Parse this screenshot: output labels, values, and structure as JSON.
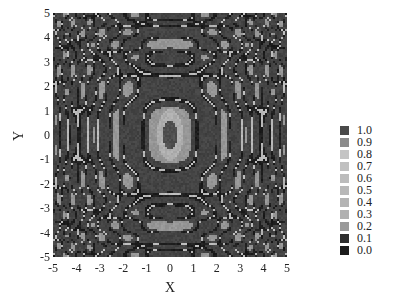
{
  "chart_data": {
    "type": "heatmap",
    "title": "",
    "xlabel": "X",
    "ylabel": "Y",
    "xlim": [
      -5,
      5
    ],
    "ylim": [
      -5,
      5
    ],
    "x_ticks": [
      "-5",
      "-4",
      "-3",
      "-2",
      "-1",
      "0",
      "1",
      "2",
      "3",
      "4",
      "5"
    ],
    "y_ticks": [
      "5",
      "4",
      "3",
      "2",
      "1",
      "0",
      "-1",
      "-2",
      "-3",
      "-4",
      "-5"
    ],
    "grid": false,
    "legend_position": "right",
    "colorscale": "grayscale (discrete, 11 levels)",
    "legend": [
      {
        "label": "1.0",
        "color": "#4a4a4a"
      },
      {
        "label": "0.9",
        "color": "#8c8c8c"
      },
      {
        "label": "0.8",
        "color": "#c4c4c4"
      },
      {
        "label": "0.7",
        "color": "#c0c0c0"
      },
      {
        "label": "0.6",
        "color": "#bcbcbc"
      },
      {
        "label": "0.5",
        "color": "#b8b8b8"
      },
      {
        "label": "0.4",
        "color": "#b4b4b4"
      },
      {
        "label": "0.3",
        "color": "#b0b0b0"
      },
      {
        "label": "0.2",
        "color": "#9a9a9a"
      },
      {
        "label": "0.1",
        "color": "#2e2e2e"
      },
      {
        "label": "0.0",
        "color": "#1c1c1c"
      }
    ]
  }
}
